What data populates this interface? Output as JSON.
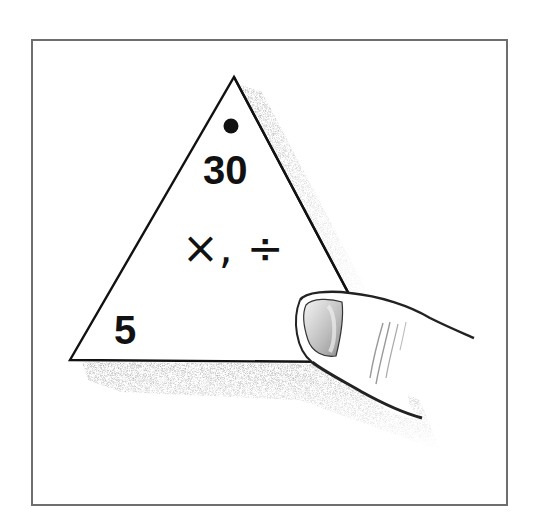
{
  "figure": {
    "triangle": {
      "top_marker": "dot",
      "top_value": "30",
      "bottom_left_value": "5",
      "bottom_right_value_hidden": true,
      "operations": "×, ÷"
    },
    "colors": {
      "border": "#6e6e6e",
      "ink": "#111111",
      "shadow": "#9a9a9a",
      "background": "#ffffff"
    }
  }
}
